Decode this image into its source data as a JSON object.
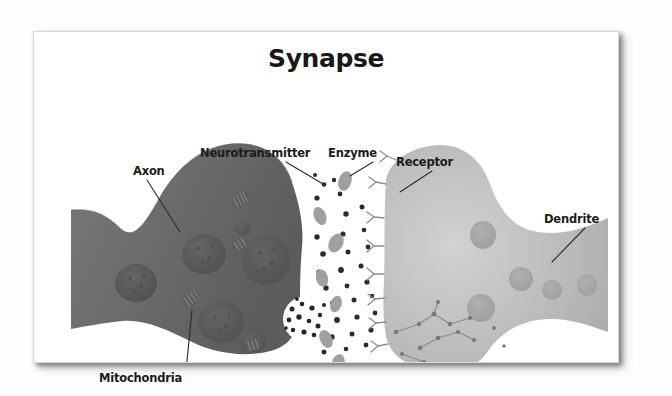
{
  "document": {
    "title": "Synapse",
    "kind": "scanned-textbook-diagram",
    "card_background": "#ffffff",
    "page_background": "#fefefe"
  },
  "diagram": {
    "type": "biological-illustration",
    "colors": {
      "axon_fill": "#6f6f6f",
      "axon_fill_dark": "#5d5d5d",
      "dendrite_fill": "#b4b4b4",
      "dendrite_fill_light": "#c9c9c9",
      "vesicle_fill": "#5a5a5a",
      "mitochondria_fill": "#5e5e5e",
      "neurotransmitter_fill": "#2b2b2b",
      "enzyme_fill": "#a0a0a0",
      "receptor_stroke": "#8f8f8f",
      "leader_line": "#2a2a2a",
      "label_text": "#1b1b1b",
      "title_text": "#181818"
    },
    "labels": [
      {
        "id": "axon",
        "text": "Axon",
        "x": 99,
        "y": 140,
        "anchor": "start"
      },
      {
        "id": "neurotransmitter",
        "text": "Neurotransmitter",
        "x": 199,
        "y": 122,
        "anchor": "start"
      },
      {
        "id": "enzyme",
        "text": "Enzyme",
        "x": 327,
        "y": 122,
        "anchor": "start"
      },
      {
        "id": "receptor",
        "text": "Receptor",
        "x": 393,
        "y": 131,
        "anchor": "start"
      },
      {
        "id": "dendrite",
        "text": "Dendrite",
        "x": 544,
        "y": 188,
        "anchor": "start"
      },
      {
        "id": "mitochondria",
        "text": "Mitochondria",
        "x": 98,
        "y": 347,
        "anchor": "start"
      }
    ],
    "structures": [
      {
        "name": "presynaptic-axon-terminal",
        "side": "left",
        "shade": "dark gray"
      },
      {
        "name": "postsynaptic-dendrite",
        "side": "right",
        "shade": "light gray"
      },
      {
        "name": "synaptic-cleft",
        "side": "center",
        "shade": "white"
      },
      {
        "name": "synaptic-vesicles",
        "count": 6
      },
      {
        "name": "mitochondria",
        "count": 4
      },
      {
        "name": "neurotransmitter-particles",
        "count": 46
      },
      {
        "name": "enzymes",
        "count": 7
      },
      {
        "name": "membrane-receptors",
        "count": 9
      },
      {
        "name": "vesicle-release-site",
        "count": 1
      }
    ]
  }
}
